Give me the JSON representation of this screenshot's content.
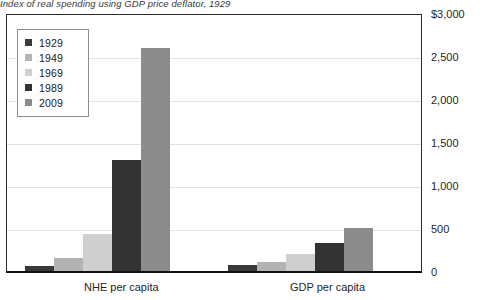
{
  "caption": "Index of real spending using GDP price deflator, 1929",
  "legend": {
    "position": "top-left",
    "entries": [
      {
        "label": "1929",
        "color": "#3a3a3a"
      },
      {
        "label": "1949",
        "color": "#b3b3b3"
      },
      {
        "label": "1969",
        "color": "#cfcfcf"
      },
      {
        "label": "1989",
        "color": "#333333"
      },
      {
        "label": "2009",
        "color": "#8c8c8c"
      }
    ]
  },
  "axes": {
    "y_ticks": [
      "$3,000",
      "2,500",
      "2,000",
      "1,500",
      "1,000",
      "500",
      "0"
    ],
    "x_labels": [
      "NHE per capita",
      "GDP per capita"
    ]
  },
  "chart_data": {
    "type": "bar",
    "title": "Index of real spending using GDP price deflator, 1929",
    "xlabel": "",
    "ylabel": "",
    "ylim": [
      0,
      3000
    ],
    "ytick_values": [
      0,
      500,
      1000,
      1500,
      2000,
      2500,
      3000
    ],
    "grid": true,
    "legend_position": "top-left",
    "categories": [
      "NHE per capita",
      "GDP per capita"
    ],
    "series": [
      {
        "name": "1929",
        "color": "#3a3a3a",
        "values": [
          60,
          70
        ]
      },
      {
        "name": "1949",
        "color": "#b3b3b3",
        "values": [
          150,
          110
        ]
      },
      {
        "name": "1969",
        "color": "#cfcfcf",
        "values": [
          430,
          200
        ]
      },
      {
        "name": "1989",
        "color": "#333333",
        "values": [
          1290,
          330
        ]
      },
      {
        "name": "2009",
        "color": "#8c8c8c",
        "values": [
          2590,
          500
        ]
      }
    ]
  }
}
